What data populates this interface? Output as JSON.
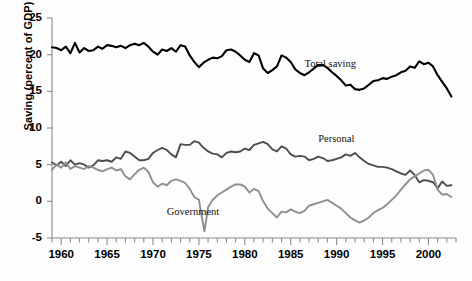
{
  "chart_data": {
    "type": "line",
    "title": "",
    "xlabel": "",
    "ylabel": "Saving (percent of GDP)",
    "xlim": [
      1959,
      2003
    ],
    "ylim": [
      -5,
      25
    ],
    "ytick_labels": [
      "25",
      "20",
      "15",
      "10",
      "5",
      "0",
      "-5"
    ],
    "ytick_values": [
      25,
      20,
      15,
      10,
      5,
      0,
      -5
    ],
    "xtick_labels": [
      "1960",
      "1965",
      "1970",
      "1975",
      "1980",
      "1985",
      "1990",
      "1995",
      "2000"
    ],
    "xtick_values": [
      1960,
      1965,
      1970,
      1975,
      1980,
      1985,
      1990,
      1995,
      2000
    ],
    "minor_tick_interval": 1,
    "grid": false,
    "legend": "inline-annotations",
    "annotations": [
      {
        "text": "Total saving",
        "x": 1986.5,
        "y": 18.6
      },
      {
        "text": "Personal",
        "x": 1988.0,
        "y": 8.4
      },
      {
        "text": "Government",
        "x": 1971.5,
        "y": -1.6
      }
    ],
    "series": [
      {
        "name": "Total saving",
        "color": "#000000",
        "width": 2.1,
        "x": [
          1959.0,
          1959.5,
          1960.0,
          1960.5,
          1961.0,
          1961.5,
          1962.0,
          1962.5,
          1963.0,
          1963.5,
          1964.0,
          1964.5,
          1965.0,
          1965.5,
          1966.0,
          1966.5,
          1967.0,
          1967.5,
          1968.0,
          1968.5,
          1969.0,
          1969.5,
          1970.0,
          1970.5,
          1971.0,
          1971.5,
          1972.0,
          1972.5,
          1973.0,
          1973.5,
          1974.0,
          1974.5,
          1975.0,
          1975.5,
          1976.0,
          1976.5,
          1977.0,
          1977.5,
          1978.0,
          1978.5,
          1979.0,
          1979.5,
          1980.0,
          1980.5,
          1981.0,
          1981.5,
          1982.0,
          1982.5,
          1983.0,
          1983.5,
          1984.0,
          1984.5,
          1985.0,
          1985.5,
          1986.0,
          1986.5,
          1987.0,
          1987.5,
          1988.0,
          1988.5,
          1989.0,
          1989.5,
          1990.0,
          1990.5,
          1991.0,
          1991.5,
          1992.0,
          1992.5,
          1993.0,
          1993.5,
          1994.0,
          1994.5,
          1995.0,
          1995.5,
          1996.0,
          1996.5,
          1997.0,
          1997.5,
          1998.0,
          1998.5,
          1999.0,
          1999.5,
          2000.0,
          2000.5,
          2001.0,
          2001.5,
          2002.0,
          2002.5
        ],
        "y": [
          21.0,
          20.9,
          20.6,
          21.1,
          20.2,
          21.6,
          20.3,
          20.9,
          20.5,
          20.6,
          21.1,
          20.8,
          21.3,
          21.2,
          21.0,
          21.2,
          20.9,
          21.3,
          21.5,
          21.3,
          21.6,
          21.1,
          20.4,
          20.0,
          20.7,
          20.5,
          20.9,
          20.4,
          21.3,
          21.1,
          19.9,
          19.0,
          18.3,
          18.9,
          19.3,
          19.6,
          19.5,
          19.8,
          20.6,
          20.7,
          20.4,
          19.9,
          19.3,
          19.0,
          20.2,
          19.9,
          18.1,
          17.5,
          17.9,
          18.4,
          19.9,
          19.6,
          19.0,
          18.0,
          17.5,
          17.2,
          17.6,
          18.1,
          18.6,
          18.6,
          18.2,
          17.6,
          17.1,
          16.5,
          15.8,
          15.9,
          15.3,
          15.2,
          15.4,
          15.9,
          16.4,
          16.5,
          16.8,
          16.7,
          17.0,
          17.2,
          17.6,
          17.8,
          18.4,
          18.2,
          19.1,
          18.7,
          18.9,
          18.4,
          17.2,
          16.3,
          15.4,
          14.3
        ]
      },
      {
        "name": "Personal",
        "color": "#4d4d4d",
        "width": 1.9,
        "x": [
          1959.0,
          1959.5,
          1960.0,
          1960.5,
          1961.0,
          1961.5,
          1962.0,
          1962.5,
          1963.0,
          1963.5,
          1964.0,
          1964.5,
          1965.0,
          1965.5,
          1966.0,
          1966.5,
          1967.0,
          1967.5,
          1968.0,
          1968.5,
          1969.0,
          1969.5,
          1970.0,
          1970.5,
          1971.0,
          1971.5,
          1972.0,
          1972.5,
          1973.0,
          1973.5,
          1974.0,
          1974.5,
          1975.0,
          1975.5,
          1976.0,
          1976.5,
          1977.0,
          1977.5,
          1978.0,
          1978.5,
          1979.0,
          1979.5,
          1980.0,
          1980.5,
          1981.0,
          1981.5,
          1982.0,
          1982.5,
          1983.0,
          1983.5,
          1984.0,
          1984.5,
          1985.0,
          1985.5,
          1986.0,
          1986.5,
          1987.0,
          1987.5,
          1988.0,
          1988.5,
          1989.0,
          1989.5,
          1990.0,
          1990.5,
          1991.0,
          1991.5,
          1992.0,
          1992.5,
          1993.0,
          1993.5,
          1994.0,
          1994.5,
          1995.0,
          1995.5,
          1996.0,
          1996.5,
          1997.0,
          1997.5,
          1998.0,
          1998.5,
          1999.0,
          1999.5,
          2000.0,
          2000.5,
          2001.0,
          2001.5,
          2002.0,
          2002.5
        ],
        "y": [
          5.3,
          4.9,
          5.4,
          4.8,
          5.6,
          5.0,
          5.2,
          5.0,
          4.6,
          4.9,
          5.6,
          5.5,
          5.6,
          5.4,
          6.0,
          5.8,
          6.8,
          6.6,
          6.1,
          5.6,
          5.6,
          5.8,
          6.6,
          7.0,
          7.3,
          7.0,
          6.4,
          6.0,
          7.8,
          7.7,
          7.7,
          8.2,
          8.0,
          7.3,
          6.8,
          6.5,
          6.4,
          6.0,
          6.6,
          6.8,
          6.7,
          6.8,
          7.2,
          7.0,
          7.7,
          7.9,
          8.1,
          7.8,
          7.1,
          6.8,
          7.5,
          7.2,
          6.4,
          6.1,
          6.2,
          6.1,
          5.6,
          5.8,
          6.1,
          5.9,
          5.5,
          5.6,
          5.8,
          6.0,
          6.4,
          6.2,
          6.6,
          6.0,
          5.5,
          5.1,
          4.9,
          4.7,
          4.7,
          4.6,
          4.4,
          4.1,
          3.8,
          3.6,
          4.2,
          3.6,
          2.6,
          2.9,
          2.8,
          2.6,
          1.8,
          2.7,
          2.1,
          2.2
        ]
      },
      {
        "name": "Government",
        "color": "#8f8f8f",
        "width": 1.9,
        "x": [
          1959.0,
          1959.5,
          1960.0,
          1960.5,
          1961.0,
          1961.5,
          1962.0,
          1962.5,
          1963.0,
          1963.5,
          1964.0,
          1964.5,
          1965.0,
          1965.5,
          1966.0,
          1966.5,
          1967.0,
          1967.5,
          1968.0,
          1968.5,
          1969.0,
          1969.5,
          1970.0,
          1970.5,
          1971.0,
          1971.5,
          1972.0,
          1972.5,
          1973.0,
          1973.5,
          1974.0,
          1974.5,
          1975.0,
          1975.3,
          1975.6,
          1976.0,
          1976.5,
          1977.0,
          1977.5,
          1978.0,
          1978.5,
          1979.0,
          1979.5,
          1980.0,
          1980.5,
          1981.0,
          1981.5,
          1982.0,
          1982.5,
          1983.0,
          1983.5,
          1984.0,
          1984.5,
          1985.0,
          1985.5,
          1986.0,
          1986.5,
          1987.0,
          1987.5,
          1988.0,
          1988.5,
          1989.0,
          1989.5,
          1990.0,
          1990.5,
          1991.0,
          1991.5,
          1992.0,
          1992.5,
          1993.0,
          1993.5,
          1994.0,
          1994.5,
          1995.0,
          1995.5,
          1996.0,
          1996.5,
          1997.0,
          1997.5,
          1998.0,
          1998.5,
          1999.0,
          1999.5,
          2000.0,
          2000.5,
          2001.0,
          2001.5,
          2002.0,
          2002.5
        ],
        "y": [
          4.3,
          5.0,
          4.6,
          5.3,
          4.4,
          4.8,
          4.6,
          4.4,
          4.8,
          4.6,
          4.3,
          4.1,
          4.4,
          4.6,
          4.2,
          4.4,
          3.4,
          3.0,
          3.7,
          4.3,
          4.6,
          4.0,
          2.6,
          2.0,
          2.4,
          2.2,
          2.8,
          3.0,
          2.8,
          2.5,
          1.7,
          0.6,
          0.2,
          -2.0,
          -4.1,
          -0.8,
          0.2,
          0.8,
          1.2,
          1.6,
          2.0,
          2.3,
          2.3,
          2.0,
          1.2,
          1.7,
          1.4,
          0.0,
          -1.0,
          -1.6,
          -2.2,
          -1.4,
          -1.5,
          -1.1,
          -1.4,
          -1.6,
          -1.3,
          -0.6,
          -0.4,
          -0.2,
          0.0,
          0.2,
          -0.2,
          -0.6,
          -1.0,
          -1.6,
          -2.2,
          -2.6,
          -2.9,
          -2.6,
          -2.2,
          -1.6,
          -1.2,
          -0.9,
          -0.4,
          0.2,
          0.8,
          1.6,
          2.3,
          3.0,
          3.4,
          3.8,
          4.2,
          4.3,
          3.6,
          1.6,
          0.9,
          1.0,
          0.6
        ]
      }
    ]
  },
  "axis": {
    "ylabel": "Saving (percent of GDP)",
    "yticks": [
      "25",
      "20",
      "15",
      "10",
      "5",
      "0",
      "-5"
    ],
    "xticks": [
      "1960",
      "1965",
      "1970",
      "1975",
      "1980",
      "1985",
      "1990",
      "1995",
      "2000"
    ]
  },
  "annotations": {
    "total_saving": "Total saving",
    "personal": "Personal",
    "government": "Government"
  },
  "caption": ""
}
